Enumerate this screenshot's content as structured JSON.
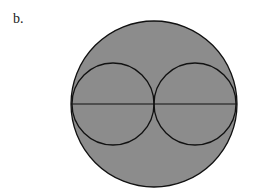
{
  "figure": {
    "label": "b.",
    "colors": {
      "fill": "#8c8c8c",
      "stroke": "#111111",
      "background": "#ffffff"
    },
    "outer_circle": {
      "cx": 154,
      "cy": 104,
      "r": 83
    },
    "inner_circles": [
      {
        "cx": 113,
        "cy": 104,
        "r": 41
      },
      {
        "cx": 195,
        "cy": 104,
        "r": 41
      }
    ],
    "diameter_line": {
      "x1": 71,
      "y1": 104,
      "x2": 237,
      "y2": 104
    }
  }
}
